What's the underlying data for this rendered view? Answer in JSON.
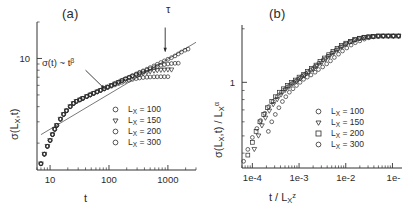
{
  "figure": {
    "background": "#ffffff",
    "marker_color": "#2b2b2b",
    "line_color": "#555555"
  },
  "panels": [
    {
      "id": "a",
      "label": "(a)",
      "xlabel_main": "t",
      "ylabel_main": "σ(L",
      "ylabel_sub": "X",
      "ylabel_tail": ",t)",
      "xticks": [
        "10",
        "100",
        "1000"
      ],
      "yticks": [
        "10"
      ],
      "annotation_power_law": "σ(t) ~ t",
      "annotation_power_law_exp": "β",
      "annotation_tau": "τ",
      "legend": [
        {
          "label": "L",
          "sub": "X",
          "value": " = 100",
          "marker": "circle"
        },
        {
          "label": "L",
          "sub": "X",
          "value": " = 150",
          "marker": "triangle-down"
        },
        {
          "label": "L",
          "sub": "X",
          "value": " = 200",
          "marker": "circle"
        },
        {
          "label": "L",
          "sub": "X",
          "value": " = 300",
          "marker": "circle"
        }
      ]
    },
    {
      "id": "b",
      "label": "(b)",
      "xlabel_main": "t / L",
      "xlabel_sub": "X",
      "xlabel_sup": "z",
      "ylabel_main": "σ(L",
      "ylabel_sub": "X",
      "ylabel_tail": ",t) / L",
      "ylabel_sub2": "X",
      "ylabel_sup": "α",
      "xticks": [
        "1e-4",
        "1e-3",
        "1e-2",
        "1e-"
      ],
      "yticks": [
        "1"
      ],
      "legend": [
        {
          "label": "L",
          "sub": "X",
          "value": " = 100",
          "marker": "circle"
        },
        {
          "label": "L",
          "sub": "X",
          "value": " = 150",
          "marker": "triangle-down"
        },
        {
          "label": "L",
          "sub": "X",
          "value": " = 200",
          "marker": "square"
        },
        {
          "label": "L",
          "sub": "X",
          "value": " = 300",
          "marker": "circle"
        }
      ]
    }
  ],
  "chart_data": [
    {
      "type": "scatter",
      "panel": "a",
      "title": "(a)",
      "xlabel": "t",
      "ylabel": "sigma(L_X,t)",
      "xscale": "log",
      "yscale": "log",
      "xlim": [
        6,
        3000
      ],
      "ylim": [
        1.2,
        20
      ],
      "xticks": [
        10,
        100,
        1000
      ],
      "yticks": [
        10
      ],
      "grid": false,
      "legend_position": "lower-right",
      "annotations": [
        {
          "text": "sigma(t) ~ t^beta",
          "x": 40,
          "y": 8.0,
          "arrow_to_x": 85,
          "arrow_to_y": 5.6
        },
        {
          "text": "tau",
          "x": 900,
          "y": 18.0,
          "arrow_to_x": 900,
          "arrow_to_y": 11.3
        }
      ],
      "guide_line": {
        "type": "power-law",
        "exponent": 0.25,
        "x": [
          7,
          3000
        ],
        "y": [
          2.35,
          13.6
        ]
      },
      "series": [
        {
          "name": "L_X = 100",
          "marker": "circle",
          "x": [
            7,
            8,
            9,
            10,
            11,
            12,
            13,
            15,
            17,
            19,
            22,
            25,
            28,
            32,
            36,
            42,
            48,
            55,
            63,
            72,
            83,
            95,
            110,
            126,
            145,
            166,
            191,
            220,
            250,
            290,
            330,
            380,
            440,
            500,
            580,
            660,
            760,
            870,
            1000
          ],
          "y": [
            1.35,
            1.62,
            1.88,
            2.1,
            2.35,
            2.6,
            2.8,
            3.15,
            3.45,
            3.7,
            4.0,
            4.25,
            4.42,
            4.55,
            4.68,
            4.85,
            5.0,
            5.15,
            5.3,
            5.45,
            5.6,
            5.75,
            5.9,
            6.05,
            6.2,
            6.35,
            6.5,
            6.62,
            6.72,
            6.82,
            6.9,
            6.96,
            7.0,
            7.03,
            7.05,
            7.06,
            7.07,
            7.07,
            7.07
          ]
        },
        {
          "name": "L_X = 150",
          "marker": "triangle-down",
          "x": [
            7,
            8,
            9,
            10,
            11,
            12,
            13,
            15,
            17,
            19,
            22,
            25,
            28,
            32,
            36,
            42,
            48,
            55,
            63,
            72,
            83,
            95,
            110,
            126,
            145,
            166,
            191,
            220,
            250,
            290,
            330,
            380,
            440,
            500,
            580,
            660,
            760,
            870,
            1000,
            1150
          ],
          "y": [
            1.35,
            1.62,
            1.88,
            2.1,
            2.35,
            2.6,
            2.8,
            3.15,
            3.45,
            3.7,
            4.0,
            4.25,
            4.42,
            4.55,
            4.68,
            4.85,
            5.0,
            5.15,
            5.3,
            5.45,
            5.62,
            5.8,
            5.98,
            6.16,
            6.34,
            6.52,
            6.7,
            6.88,
            7.05,
            7.2,
            7.35,
            7.5,
            7.65,
            7.78,
            7.88,
            7.95,
            8.0,
            8.03,
            8.05,
            8.05
          ]
        },
        {
          "name": "L_X = 200",
          "marker": "circle",
          "x": [
            7,
            8,
            9,
            10,
            11,
            12,
            13,
            15,
            17,
            19,
            22,
            25,
            28,
            32,
            36,
            42,
            48,
            55,
            63,
            72,
            83,
            95,
            110,
            126,
            145,
            166,
            191,
            220,
            250,
            290,
            330,
            380,
            440,
            500,
            580,
            660,
            760,
            870,
            1000,
            1150,
            1320,
            1500
          ],
          "y": [
            1.35,
            1.62,
            1.88,
            2.1,
            2.35,
            2.6,
            2.8,
            3.15,
            3.45,
            3.7,
            4.0,
            4.25,
            4.42,
            4.55,
            4.68,
            4.85,
            5.0,
            5.15,
            5.3,
            5.45,
            5.62,
            5.8,
            5.98,
            6.18,
            6.38,
            6.58,
            6.78,
            6.98,
            7.18,
            7.4,
            7.6,
            7.8,
            8.0,
            8.2,
            8.4,
            8.6,
            8.78,
            8.9,
            9.0,
            9.08,
            9.12,
            9.14
          ]
        },
        {
          "name": "L_X = 300",
          "marker": "circle",
          "x": [
            7,
            8,
            9,
            10,
            11,
            12,
            13,
            15,
            17,
            19,
            22,
            25,
            28,
            32,
            36,
            42,
            48,
            55,
            63,
            72,
            83,
            95,
            110,
            126,
            145,
            166,
            191,
            220,
            250,
            290,
            330,
            380,
            440,
            500,
            580,
            660,
            760,
            870,
            1000,
            1150,
            1320,
            1500,
            1700,
            1950,
            2200
          ],
          "y": [
            1.35,
            1.62,
            1.88,
            2.1,
            2.35,
            2.6,
            2.8,
            3.15,
            3.45,
            3.7,
            4.0,
            4.25,
            4.42,
            4.55,
            4.68,
            4.85,
            5.0,
            5.15,
            5.3,
            5.45,
            5.62,
            5.8,
            5.98,
            6.18,
            6.38,
            6.58,
            6.8,
            7.0,
            7.2,
            7.45,
            7.68,
            7.9,
            8.15,
            8.4,
            8.68,
            8.95,
            9.25,
            9.55,
            9.85,
            10.15,
            10.5,
            10.9,
            11.3,
            11.7,
            11.95
          ]
        }
      ]
    },
    {
      "type": "scatter",
      "panel": "b",
      "title": "(b)",
      "xlabel": "t / L_X^z",
      "ylabel": "sigma(L_X,t) / L_X^alpha",
      "xscale": "log",
      "yscale": "log",
      "xlim": [
        6e-05,
        0.16
      ],
      "ylim": [
        0.33,
        2.1
      ],
      "xticks": [
        0.0001,
        0.001,
        0.01,
        0.1
      ],
      "yticks": [
        1
      ],
      "grid": false,
      "legend_position": "lower-right",
      "note": "data collapse of panel (a) curves onto a single scaling function",
      "series": [
        {
          "name": "L_X = 100",
          "marker": "circle",
          "x": [
            0.00022,
            0.00026,
            0.00031,
            0.00037,
            0.00044,
            0.00052,
            0.00062,
            0.00074,
            0.00088,
            0.00105,
            0.00125,
            0.0015,
            0.0018,
            0.0022,
            0.0026,
            0.0032,
            0.0039,
            0.0047,
            0.0057,
            0.007,
            0.0085,
            0.0105,
            0.013,
            0.016,
            0.02,
            0.025,
            0.031,
            0.039,
            0.05,
            0.064,
            0.082,
            0.105,
            0.135
          ],
          "y": [
            0.53,
            0.6,
            0.66,
            0.72,
            0.78,
            0.83,
            0.88,
            0.92,
            0.96,
            1.0,
            1.04,
            1.07,
            1.1,
            1.14,
            1.18,
            1.22,
            1.27,
            1.32,
            1.38,
            1.44,
            1.5,
            1.56,
            1.62,
            1.67,
            1.71,
            1.75,
            1.78,
            1.8,
            1.81,
            1.82,
            1.82,
            1.82,
            1.82
          ]
        },
        {
          "name": "L_X = 150",
          "marker": "triangle-down",
          "x": [
            0.00011,
            0.000135,
            0.00016,
            0.00019,
            0.00023,
            0.00028,
            0.00034,
            0.00041,
            0.0005,
            0.0006,
            0.00073,
            0.00089,
            0.00108,
            0.0013,
            0.0016,
            0.002,
            0.0024,
            0.003,
            0.0037,
            0.0045,
            0.0055,
            0.0068,
            0.0084,
            0.0103,
            0.013,
            0.016,
            0.02,
            0.025,
            0.031,
            0.039,
            0.05,
            0.064,
            0.082,
            0.105,
            0.135
          ],
          "y": [
            0.42,
            0.5,
            0.57,
            0.63,
            0.69,
            0.75,
            0.8,
            0.85,
            0.9,
            0.94,
            0.98,
            1.01,
            1.05,
            1.09,
            1.13,
            1.18,
            1.23,
            1.28,
            1.34,
            1.4,
            1.46,
            1.52,
            1.58,
            1.64,
            1.69,
            1.73,
            1.76,
            1.79,
            1.8,
            1.81,
            1.82,
            1.82,
            1.82,
            1.82,
            1.82
          ]
        },
        {
          "name": "L_X = 200",
          "marker": "square",
          "x": [
            8e-05,
            0.0001,
            0.00012,
            0.000145,
            0.000175,
            0.00021,
            0.00026,
            0.00031,
            0.00038,
            0.00046,
            0.00056,
            0.00068,
            0.00083,
            0.001,
            0.00125,
            0.0015,
            0.00185,
            0.0023,
            0.0028,
            0.0035,
            0.0043,
            0.0053,
            0.0065,
            0.008,
            0.01,
            0.0125,
            0.0155,
            0.0195,
            0.0245,
            0.031,
            0.039,
            0.05,
            0.064,
            0.082,
            0.105,
            0.135
          ],
          "y": [
            0.39,
            0.46,
            0.53,
            0.6,
            0.66,
            0.72,
            0.78,
            0.83,
            0.88,
            0.92,
            0.96,
            1.0,
            1.03,
            1.07,
            1.11,
            1.15,
            1.2,
            1.25,
            1.31,
            1.37,
            1.43,
            1.49,
            1.55,
            1.61,
            1.66,
            1.7,
            1.74,
            1.77,
            1.79,
            1.8,
            1.81,
            1.82,
            1.82,
            1.82,
            1.82,
            1.82
          ]
        },
        {
          "name": "L_X = 300",
          "marker": "circle",
          "x": [
            6.5e-05,
            8e-05,
            0.0001,
            0.000125,
            0.00015,
            0.000185,
            0.000225,
            0.00028,
            0.00034,
            0.00042,
            0.00051,
            0.00063,
            0.00077,
            0.00094,
            0.00115,
            0.0014,
            0.00175,
            0.00215,
            0.00265,
            0.0033,
            0.0041,
            0.005,
            0.0062,
            0.0077,
            0.0095,
            0.012,
            0.015,
            0.019,
            0.024,
            0.03,
            0.038,
            0.049,
            0.063,
            0.081,
            0.104,
            0.135
          ],
          "y": [
            0.36,
            0.42,
            0.49,
            0.55,
            0.61,
            0.67,
            0.73,
            0.78,
            0.83,
            0.88,
            0.92,
            0.96,
            1.0,
            1.04,
            1.08,
            1.12,
            1.17,
            1.22,
            1.28,
            1.34,
            1.4,
            1.46,
            1.52,
            1.58,
            1.63,
            1.68,
            1.72,
            1.76,
            1.78,
            1.8,
            1.81,
            1.82,
            1.82,
            1.82,
            1.82,
            1.82
          ]
        }
      ]
    }
  ]
}
